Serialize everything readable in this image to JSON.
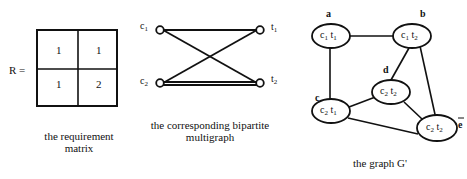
{
  "matrix": {
    "label": "R =",
    "cells": [
      [
        "1",
        "1"
      ],
      [
        "1",
        "2"
      ]
    ],
    "caption_line1": "the requirement",
    "caption_line2": "matrix"
  },
  "bipartite": {
    "left_nodes": [
      "c1",
      "c2"
    ],
    "right_nodes": [
      "t1",
      "t2"
    ],
    "edges": [
      [
        "c1",
        "t1"
      ],
      [
        "c1",
        "t2"
      ],
      [
        "c2",
        "t1"
      ],
      [
        "c2",
        "t2"
      ],
      [
        "c2",
        "t2"
      ]
    ],
    "caption_line1": "the corresponding bipartite",
    "caption_line2": "multigraph"
  },
  "graph": {
    "nodes": [
      {
        "id": "a",
        "label": "c1 t1"
      },
      {
        "id": "b",
        "label": "c1 t2"
      },
      {
        "id": "c",
        "label": "c2 t1"
      },
      {
        "id": "d",
        "label": "c2 t2"
      },
      {
        "id": "e",
        "label": "c2 t2",
        "marker": "ē"
      }
    ],
    "edges": [
      [
        "a",
        "b"
      ],
      [
        "a",
        "c"
      ],
      [
        "b",
        "d"
      ],
      [
        "b",
        "e"
      ],
      [
        "c",
        "d"
      ],
      [
        "c",
        "e"
      ],
      [
        "d",
        "e"
      ]
    ],
    "caption": "the graph G'"
  }
}
